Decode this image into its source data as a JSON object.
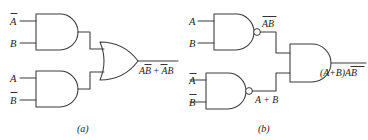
{
  "figure": {
    "background_color": "#ffffff",
    "line_color": "#3a3a3a",
    "text_color": "#1c1c1c",
    "captions": {
      "left": "(a)",
      "right": "(b)"
    }
  },
  "circuit_a": {
    "caption": "(a)",
    "gate_top": {
      "type": "AND",
      "inputs": [
        {
          "label": "A",
          "overbar": true
        },
        {
          "label": "B",
          "overbar": false
        }
      ]
    },
    "gate_bottom": {
      "type": "AND",
      "inputs": [
        {
          "label": "A",
          "overbar": false
        },
        {
          "label": "B",
          "overbar": true
        }
      ]
    },
    "gate_output": {
      "type": "OR"
    },
    "output_expression": {
      "term1_first": "A",
      "term1_second": "B",
      "term1_second_overbar": true,
      "plus": "+",
      "term2_first": "A",
      "term2_first_overbar": true,
      "term2_second": "B"
    }
  },
  "circuit_b": {
    "caption": "(b)",
    "gate_top": {
      "type": "NAND",
      "inputs": [
        {
          "label": "A",
          "overbar": false
        },
        {
          "label": "B",
          "overbar": false
        }
      ],
      "output_label": {
        "text": "AB",
        "overbar": true
      }
    },
    "gate_bottom": {
      "type": "NAND",
      "inputs": [
        {
          "label": "A",
          "overbar": true
        },
        {
          "label": "B",
          "overbar": true
        }
      ],
      "output_label": {
        "text": "A + B",
        "overbar": false
      }
    },
    "gate_output": {
      "type": "AND"
    },
    "output_expression": {
      "group": "(A+B)",
      "group_overbar": false,
      "second": "AB",
      "second_overbar": true
    }
  }
}
